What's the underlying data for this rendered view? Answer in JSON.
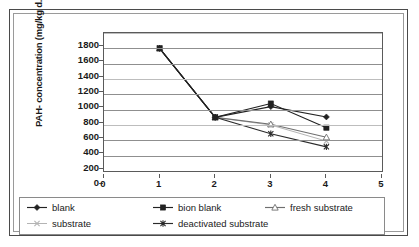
{
  "chart_data": {
    "type": "line",
    "title": "",
    "xlabel": "",
    "ylabel": "PAH- concentration (mg/kg d.m.)",
    "x": [
      1,
      2,
      3,
      4
    ],
    "xticks": [
      "0",
      "1",
      "2",
      "3",
      "4",
      "5"
    ],
    "xlim": [
      0,
      5
    ],
    "yticks": [
      "0",
      "200",
      "400",
      "600",
      "800",
      "1000",
      "1200",
      "1400",
      "1600",
      "1800"
    ],
    "ylim": [
      0,
      1800
    ],
    "grid": true,
    "legend_position": "bottom",
    "series": [
      {
        "name": "blank",
        "marker": "filled-diamond",
        "color": "#222222",
        "values": [
          1600,
          700,
          840,
          705
        ]
      },
      {
        "name": "bion blank",
        "marker": "filled-square",
        "color": "#222222",
        "values": [
          1600,
          700,
          880,
          565
        ]
      },
      {
        "name": "fresh substrate",
        "marker": "open-triangle",
        "color": "#6f6f6f",
        "values": [
          1600,
          700,
          610,
          440
        ]
      },
      {
        "name": "substrate",
        "marker": "cross-x",
        "color": "#b4b4b4",
        "values": [
          1600,
          700,
          600,
          390
        ]
      },
      {
        "name": "deactivated substrate",
        "marker": "asterisk",
        "color": "#2b2b2b",
        "values": [
          1600,
          700,
          485,
          315
        ]
      }
    ]
  },
  "legend": {
    "items": [
      {
        "label": "blank"
      },
      {
        "label": "bion blank"
      },
      {
        "label": "fresh substrate"
      },
      {
        "label": "substrate"
      },
      {
        "label": "deactivated substrate"
      }
    ]
  }
}
